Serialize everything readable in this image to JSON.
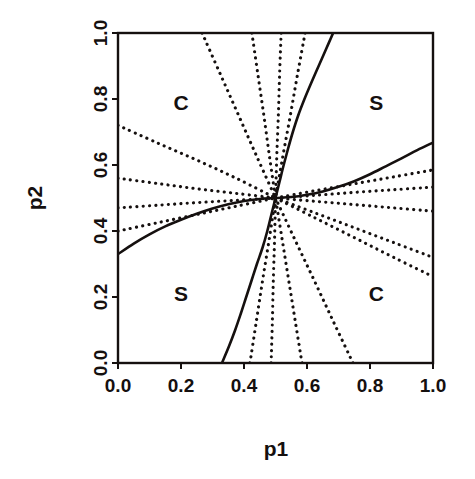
{
  "chart_data": {
    "type": "line",
    "title": "",
    "xlabel": "p1",
    "ylabel": "p2",
    "xlim": [
      0.0,
      1.0
    ],
    "ylim": [
      0.0,
      1.0
    ],
    "xticks": [
      "0.0",
      "0.2",
      "0.4",
      "0.6",
      "0.8",
      "1.0"
    ],
    "xtick_values": [
      0.0,
      0.2,
      0.4,
      0.6,
      0.8,
      1.0
    ],
    "yticks": [
      "0.0",
      "0.2",
      "0.4",
      "0.6",
      "0.8",
      "1.0"
    ],
    "ytick_values": [
      0.0,
      0.2,
      0.4,
      0.6,
      0.8,
      1.0
    ],
    "grid": false,
    "legend": "none",
    "frame": true,
    "line_color": "#15100f",
    "background": "#ffffff",
    "annotations": [
      {
        "text": "C",
        "x": 0.2,
        "y": 0.79
      },
      {
        "text": "S",
        "x": 0.82,
        "y": 0.79
      },
      {
        "text": "S",
        "x": 0.2,
        "y": 0.21
      },
      {
        "text": "C",
        "x": 0.82,
        "y": 0.21
      }
    ],
    "crossing_point": {
      "x": 0.5,
      "y": 0.5
    },
    "series": [
      {
        "name": "boundary-curve-1",
        "style": "solid",
        "points": [
          [
            0.0,
            0.33
          ],
          [
            0.05,
            0.362
          ],
          [
            0.1,
            0.39
          ],
          [
            0.15,
            0.414
          ],
          [
            0.2,
            0.434
          ],
          [
            0.25,
            0.452
          ],
          [
            0.3,
            0.468
          ],
          [
            0.35,
            0.481
          ],
          [
            0.4,
            0.491
          ],
          [
            0.45,
            0.497
          ],
          [
            0.5,
            0.5
          ],
          [
            0.55,
            0.503
          ],
          [
            0.6,
            0.51
          ],
          [
            0.65,
            0.52
          ],
          [
            0.7,
            0.534
          ],
          [
            0.75,
            0.551
          ],
          [
            0.8,
            0.572
          ],
          [
            0.85,
            0.596
          ],
          [
            0.9,
            0.62
          ],
          [
            0.95,
            0.645
          ],
          [
            1.0,
            0.668
          ]
        ]
      },
      {
        "name": "boundary-curve-2",
        "style": "solid",
        "points": [
          [
            0.33,
            0.0
          ],
          [
            0.352,
            0.05
          ],
          [
            0.372,
            0.1
          ],
          [
            0.39,
            0.15
          ],
          [
            0.407,
            0.2
          ],
          [
            0.424,
            0.25
          ],
          [
            0.441,
            0.3
          ],
          [
            0.459,
            0.35
          ],
          [
            0.474,
            0.4
          ],
          [
            0.487,
            0.45
          ],
          [
            0.5,
            0.5
          ],
          [
            0.513,
            0.55
          ],
          [
            0.526,
            0.6
          ],
          [
            0.54,
            0.65
          ],
          [
            0.555,
            0.7
          ],
          [
            0.572,
            0.75
          ],
          [
            0.592,
            0.8
          ],
          [
            0.614,
            0.85
          ],
          [
            0.637,
            0.9
          ],
          [
            0.66,
            0.95
          ],
          [
            0.683,
            1.0
          ]
        ]
      },
      {
        "name": "ray-upleft-1",
        "style": "dotted",
        "points": [
          [
            0.0,
            0.72
          ],
          [
            0.125,
            0.667
          ],
          [
            0.25,
            0.615
          ],
          [
            0.375,
            0.56
          ],
          [
            0.5,
            0.5
          ]
        ]
      },
      {
        "name": "ray-upleft-2",
        "style": "dotted",
        "points": [
          [
            0.0,
            0.56
          ],
          [
            0.125,
            0.544
          ],
          [
            0.25,
            0.528
          ],
          [
            0.375,
            0.514
          ],
          [
            0.5,
            0.5
          ]
        ]
      },
      {
        "name": "ray-left-3",
        "style": "dotted",
        "points": [
          [
            0.0,
            0.47
          ],
          [
            0.125,
            0.478
          ],
          [
            0.25,
            0.486
          ],
          [
            0.375,
            0.493
          ],
          [
            0.5,
            0.5
          ]
        ]
      },
      {
        "name": "ray-left-4",
        "style": "dotted",
        "points": [
          [
            0.0,
            0.4
          ],
          [
            0.125,
            0.425
          ],
          [
            0.25,
            0.45
          ],
          [
            0.375,
            0.475
          ],
          [
            0.5,
            0.5
          ]
        ]
      },
      {
        "name": "ray-up-1",
        "style": "dotted",
        "points": [
          [
            0.267,
            1.0
          ],
          [
            0.325,
            0.875
          ],
          [
            0.383,
            0.75
          ],
          [
            0.441,
            0.625
          ],
          [
            0.5,
            0.5
          ]
        ]
      },
      {
        "name": "ray-up-2",
        "style": "dotted",
        "points": [
          [
            0.425,
            1.0
          ],
          [
            0.444,
            0.875
          ],
          [
            0.463,
            0.75
          ],
          [
            0.481,
            0.625
          ],
          [
            0.5,
            0.5
          ]
        ]
      },
      {
        "name": "ray-up-3",
        "style": "dotted",
        "points": [
          [
            0.518,
            1.0
          ],
          [
            0.513,
            0.875
          ],
          [
            0.509,
            0.75
          ],
          [
            0.504,
            0.625
          ],
          [
            0.5,
            0.5
          ]
        ]
      },
      {
        "name": "ray-up-4",
        "style": "dotted",
        "points": [
          [
            0.594,
            1.0
          ],
          [
            0.57,
            0.875
          ],
          [
            0.547,
            0.75
          ],
          [
            0.523,
            0.625
          ],
          [
            0.5,
            0.5
          ]
        ]
      },
      {
        "name": "ray-down-1",
        "style": "dotted",
        "points": [
          [
            0.419,
            0.0
          ],
          [
            0.439,
            0.125
          ],
          [
            0.459,
            0.25
          ],
          [
            0.48,
            0.375
          ],
          [
            0.5,
            0.5
          ]
        ]
      },
      {
        "name": "ray-down-2",
        "style": "dotted",
        "points": [
          [
            0.486,
            0.0
          ],
          [
            0.49,
            0.125
          ],
          [
            0.493,
            0.25
          ],
          [
            0.497,
            0.375
          ],
          [
            0.5,
            0.5
          ]
        ]
      },
      {
        "name": "ray-down-3",
        "style": "dotted",
        "points": [
          [
            0.584,
            0.0
          ],
          [
            0.563,
            0.125
          ],
          [
            0.542,
            0.25
          ],
          [
            0.521,
            0.375
          ],
          [
            0.5,
            0.5
          ]
        ]
      },
      {
        "name": "ray-down-4",
        "style": "dotted",
        "points": [
          [
            0.746,
            0.0
          ],
          [
            0.684,
            0.125
          ],
          [
            0.623,
            0.25
          ],
          [
            0.561,
            0.375
          ],
          [
            0.5,
            0.5
          ]
        ]
      },
      {
        "name": "ray-right-1",
        "style": "dotted",
        "points": [
          [
            0.5,
            0.5
          ],
          [
            0.625,
            0.522
          ],
          [
            0.75,
            0.543
          ],
          [
            0.875,
            0.564
          ],
          [
            1.0,
            0.585
          ]
        ]
      },
      {
        "name": "ray-right-2",
        "style": "dotted",
        "points": [
          [
            0.5,
            0.5
          ],
          [
            0.625,
            0.508
          ],
          [
            0.75,
            0.517
          ],
          [
            0.875,
            0.525
          ],
          [
            1.0,
            0.533
          ]
        ]
      },
      {
        "name": "ray-right-3",
        "style": "dotted",
        "points": [
          [
            0.5,
            0.5
          ],
          [
            0.625,
            0.49
          ],
          [
            0.75,
            0.48
          ],
          [
            0.875,
            0.47
          ],
          [
            1.0,
            0.46
          ]
        ]
      },
      {
        "name": "ray-right-4",
        "style": "dotted",
        "points": [
          [
            0.5,
            0.5
          ],
          [
            0.625,
            0.455
          ],
          [
            0.75,
            0.41
          ],
          [
            0.875,
            0.365
          ],
          [
            1.0,
            0.32
          ]
        ]
      },
      {
        "name": "ray-right-5",
        "style": "dotted",
        "points": [
          [
            0.5,
            0.5
          ],
          [
            0.625,
            0.44
          ],
          [
            0.75,
            0.38
          ],
          [
            0.875,
            0.32
          ],
          [
            1.0,
            0.262
          ]
        ]
      }
    ]
  }
}
